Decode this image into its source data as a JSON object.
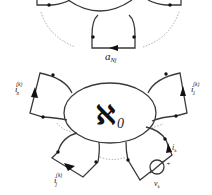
{
  "diagram": {
    "type": "circuit-network-schematic",
    "top_panel": {
      "branch_label": "a",
      "branch_label_sub": "Nj"
    },
    "bottom_panel": {
      "network_symbol": "ℵ",
      "network_sub": "0",
      "branches": [
        {
          "id": "n",
          "label": "i",
          "sub": "n",
          "sup": "(k)"
        },
        {
          "id": "1",
          "label": "i",
          "sub": "1",
          "sup": "(k)"
        },
        {
          "id": "j",
          "label": "i",
          "sub": "j",
          "sup": "(k)"
        },
        {
          "id": "k",
          "label": "i",
          "sub": "k",
          "sup": ""
        }
      ],
      "source": {
        "label": "v",
        "sub": "k",
        "polarity": "+"
      }
    },
    "colors": {
      "line": "#3a3a3a",
      "dotted": "#9a9a9a",
      "node": "#111111"
    }
  }
}
